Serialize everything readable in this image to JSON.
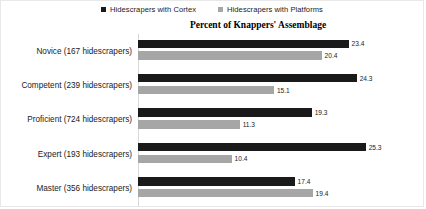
{
  "chart_data": {
    "type": "bar",
    "orientation": "horizontal",
    "title": "Percent of Knappers' Assemblage",
    "xlabel": "",
    "ylabel": "",
    "xlim": [
      0,
      27
    ],
    "grid": false,
    "legend_position": "top-center",
    "categories": [
      "Novice (167 hidescrapers)",
      "Competent (239 hidescrapers)",
      "Proficient (724 hidescrapers)",
      "Expert (193 hidescrapers)",
      "Master (356 hidescrapers)"
    ],
    "series": [
      {
        "name": "Hidescrapers with Cortex",
        "color": "#1a1a1a",
        "values": [
          23.4,
          24.3,
          19.3,
          25.3,
          17.4
        ]
      },
      {
        "name": "Hidescrapers with Platforms",
        "color": "#a6a6a6",
        "values": [
          20.4,
          15.1,
          11.3,
          10.4,
          19.4
        ]
      }
    ]
  },
  "legend": {
    "entries": [
      {
        "label": "Hidescrapers with Cortex",
        "swatch": "cortex-swatch"
      },
      {
        "label": "Hidescrapers with Platforms",
        "swatch": "platforms-swatch"
      }
    ]
  }
}
